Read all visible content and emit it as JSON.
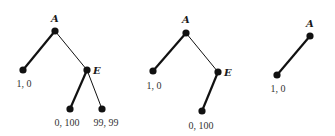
{
  "colors": {
    "ink": "#111111",
    "text": "#333333"
  },
  "trees": [
    {
      "name": "full-game",
      "nodes": {
        "A": {
          "label": "A"
        },
        "E": {
          "label": "E"
        }
      },
      "leaves": [
        {
          "payoff": "1, 0"
        },
        {
          "payoff": "0, 100"
        },
        {
          "payoff": "99, 99"
        }
      ]
    },
    {
      "name": "pruned-game",
      "nodes": {
        "A": {
          "label": "A"
        },
        "E": {
          "label": "E"
        }
      },
      "leaves": [
        {
          "payoff": "1, 0"
        },
        {
          "payoff": "0, 100"
        }
      ]
    },
    {
      "name": "reduced-game",
      "nodes": {
        "A": {
          "label": "A"
        }
      },
      "leaves": [
        {
          "payoff": "1, 0"
        }
      ]
    }
  ]
}
